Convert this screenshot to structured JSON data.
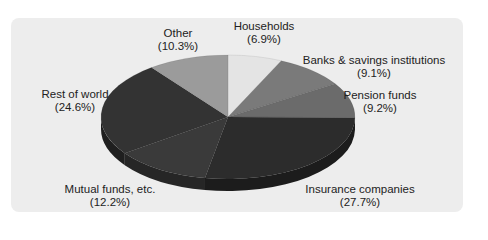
{
  "chart_data": {
    "type": "pie",
    "style": "3d",
    "title": "",
    "start_angle_deg": 0,
    "direction": "clockwise",
    "slices": [
      {
        "label": "Households",
        "value": 6.9,
        "pct_label": "(6.9%)",
        "color": "#e4e4e4",
        "side": "#bdbdbd"
      },
      {
        "label": "Banks & savings institutions",
        "value": 9.1,
        "pct_label": "(9.1%)",
        "color": "#7a7a7a",
        "side": "#5a5a5a"
      },
      {
        "label": "Pension funds",
        "value": 9.2,
        "pct_label": "(9.2%)",
        "color": "#6b6b6b",
        "side": "#4e4e4e"
      },
      {
        "label": "Insurance companies",
        "value": 27.7,
        "pct_label": "(27.7%)",
        "color": "#2c2c2c",
        "side": "#1c1c1c"
      },
      {
        "label": "Mutual funds, etc.",
        "value": 12.2,
        "pct_label": "(12.2%)",
        "color": "#3a3a3a",
        "side": "#262626"
      },
      {
        "label": "Rest of world",
        "value": 24.6,
        "pct_label": "(24.6%)",
        "color": "#333333",
        "side": "#1f1f1f"
      },
      {
        "label": "Other",
        "value": 10.3,
        "pct_label": "(10.3%)",
        "color": "#9b9b9b",
        "side": "#777777"
      }
    ]
  },
  "labels": [
    {
      "name": "households",
      "line1": "Households",
      "line2": "(6.9%)",
      "x": 264,
      "y": 20
    },
    {
      "name": "banks",
      "line1": "Banks & savings institutions",
      "line2": "(9.1%)",
      "x": 374,
      "y": 54
    },
    {
      "name": "pension",
      "line1": "Pension funds",
      "line2": "(9.2%)",
      "x": 380,
      "y": 89
    },
    {
      "name": "insurance",
      "line1": "Insurance companies",
      "line2": "(27.7%)",
      "x": 360,
      "y": 183
    },
    {
      "name": "mutual",
      "line1": "Mutual funds, etc.",
      "line2": "(12.2%)",
      "x": 110,
      "y": 183
    },
    {
      "name": "rest-of-world",
      "line1": "Rest of world",
      "line2": "(24.6%)",
      "x": 75,
      "y": 88
    },
    {
      "name": "other",
      "line1": "Other",
      "line2": "(10.3%)",
      "x": 178,
      "y": 27
    }
  ]
}
